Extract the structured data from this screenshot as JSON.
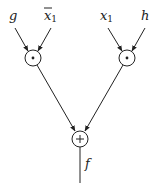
{
  "diagram": {
    "type": "logic-circuit",
    "inputs": [
      {
        "id": "g",
        "label": "g",
        "subscript": ""
      },
      {
        "id": "xbar1",
        "label": "x",
        "subscript": "1",
        "overline": true
      },
      {
        "id": "x1",
        "label": "x",
        "subscript": "1"
      },
      {
        "id": "h",
        "label": "h",
        "subscript": ""
      }
    ],
    "nodes": [
      {
        "id": "and-left",
        "symbol": "·",
        "inputs": [
          "g",
          "xbar1"
        ]
      },
      {
        "id": "and-right",
        "symbol": "·",
        "inputs": [
          "x1",
          "h"
        ]
      },
      {
        "id": "or-out",
        "symbol": "+",
        "inputs": [
          "and-left",
          "and-right"
        ]
      }
    ],
    "output": {
      "label": "f"
    },
    "colors": {
      "stroke": "#222222",
      "background": "#ffffff"
    }
  }
}
